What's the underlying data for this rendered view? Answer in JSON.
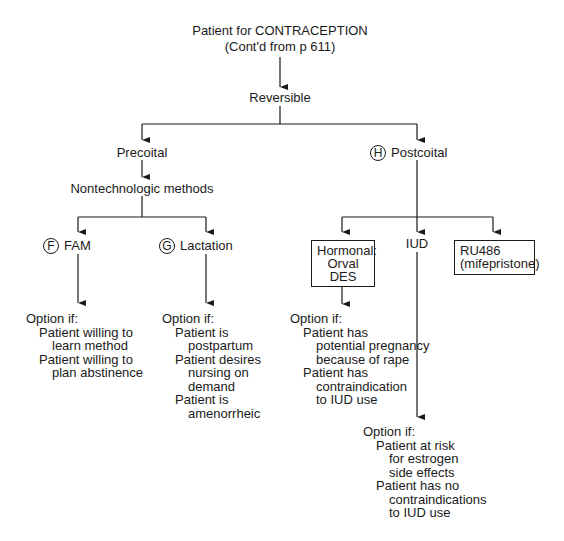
{
  "root": {
    "title": "Patient for CONTRACEPTION",
    "subtitle": "(Cont'd from p 611)"
  },
  "reversible": "Reversible",
  "precoital": {
    "label": "Precoital",
    "child": "Nontechnologic methods",
    "fam": {
      "badge": "F",
      "label": "FAM",
      "option_header": "Option if:",
      "conditions": [
        {
          "line1": "Patient willing to",
          "line2": "learn method"
        },
        {
          "line1": "Patient willing to",
          "line2": "plan abstinence"
        }
      ]
    },
    "lactation": {
      "badge": "G",
      "label": "Lactation",
      "option_header": "Option if:",
      "conditions": [
        {
          "line1": "Patient is",
          "line2": "postpartum"
        },
        {
          "line1": "Patient desires",
          "line2": "nursing on",
          "line3": "demand"
        },
        {
          "line1": "Patient is",
          "line2": "amenorrheic"
        }
      ]
    }
  },
  "postcoital": {
    "badge": "H",
    "label": "Postcoital",
    "hormonal": {
      "line1": "Hormonal:",
      "line2": "Orval",
      "line3": "DES",
      "option_header": "Option if:",
      "conditions": [
        {
          "line1": "Patient has",
          "line2": "potential pregnancy",
          "line3": "because of rape"
        },
        {
          "line1": "Patient has",
          "line2": "contraindication",
          "line3": "to IUD use"
        }
      ]
    },
    "iud": {
      "label": "IUD",
      "option_header": "Option if:",
      "conditions": [
        {
          "line1": "Patient at risk",
          "line2": "for estrogen",
          "line3": "side effects"
        },
        {
          "line1": "Patient has no",
          "line2": "contraindications",
          "line3": "to IUD use"
        }
      ]
    },
    "ru486": {
      "line1": "RU486",
      "line2": "(mifepristone)"
    }
  },
  "colors": {
    "ink": "#1a1a1a",
    "background": "#ffffff"
  }
}
